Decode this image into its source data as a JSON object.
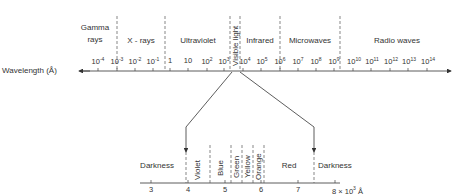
{
  "top_axis": {
    "label": "Wavelength (Å)",
    "bands": [
      {
        "line1": "Gamma",
        "line2": "rays"
      },
      {
        "line1": "X - rays"
      },
      {
        "line1": "Ultraviolet"
      },
      {
        "line1": "Visible light"
      },
      {
        "line1": "Infrared"
      },
      {
        "line1": "Microwaves"
      },
      {
        "line1": "Radio waves"
      }
    ],
    "ticks": [
      {
        "base": "10",
        "exp": "-4"
      },
      {
        "base": "10",
        "exp": "-3"
      },
      {
        "base": "10",
        "exp": "-2"
      },
      {
        "base": "10",
        "exp": "-1"
      },
      {
        "base": "1",
        "exp": ""
      },
      {
        "base": "10",
        "exp": ""
      },
      {
        "base": "10",
        "exp": "2"
      },
      {
        "base": "10",
        "exp": "3"
      },
      {
        "base": "10",
        "exp": "4"
      },
      {
        "base": "10",
        "exp": "5"
      },
      {
        "base": "10",
        "exp": "6"
      },
      {
        "base": "10",
        "exp": "7"
      },
      {
        "base": "10",
        "exp": "8"
      },
      {
        "base": "10",
        "exp": "9"
      },
      {
        "base": "10",
        "exp": "10"
      },
      {
        "base": "10",
        "exp": "11"
      },
      {
        "base": "10",
        "exp": "12"
      },
      {
        "base": "10",
        "exp": "13"
      },
      {
        "base": "10",
        "exp": "14"
      }
    ]
  },
  "bottom_axis": {
    "regions": [
      "Darkness",
      "Violet",
      "Blue",
      "Green",
      "Yellow",
      "Orange",
      "Red",
      "Darkness"
    ],
    "ticks": [
      "3",
      "4",
      "5",
      "6",
      "7"
    ],
    "last_tick": {
      "text": "8 × 10",
      "exp": "3",
      "unit": "Å"
    }
  },
  "colors": {
    "ink": "#333333",
    "background": "#ffffff"
  }
}
